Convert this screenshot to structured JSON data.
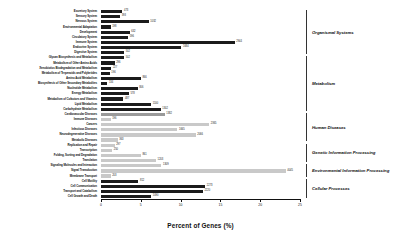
{
  "chart_data": {
    "type": "bar",
    "title": "",
    "xlabel": "Percent of Genes (%)",
    "ylabel": "",
    "xlim": [
      0,
      25
    ],
    "xticks": [
      0,
      5,
      10,
      15,
      20,
      25
    ],
    "xtick_labels": [
      "0",
      "5",
      "10",
      "15",
      "20",
      "25"
    ],
    "grid": false,
    "orientation": "horizontal",
    "legend": "none",
    "categories": [
      "Excretory System",
      "Sensory System",
      "Nervous System",
      "Environmental Adaptation",
      "Development",
      "Circulatory System",
      "Immune System",
      "Endocrine System",
      "Digestive System",
      "Glycan Biosynthesis and Metabolism",
      "Metabolism of Other Amino Acids",
      "Xenobiotics Biodegradation and Metabolism",
      "Metabolism of Terpenoids and Polyketides",
      "Amino Acid Metabolism",
      "Biosynthesis of Other Secondary Metabolites",
      "Nucleotide Metabolism",
      "Energy Metabolism",
      "Metabolism of Cofactors and Vitamins",
      "Lipid Metabolism",
      "Carbohydrate Metabolism",
      "Cardiovascular Diseases",
      "Immune Diseases",
      "Cancers",
      "Infectious Diseases",
      "Neurodegenerative Diseases",
      "Metabolic Diseases",
      "Replication and Repair",
      "Transcription",
      "Folding, Sorting and Degradation",
      "Translation",
      "Signaling Molecules and Interaction",
      "Signal Transduction",
      "Membrane Transport",
      "Cell Motility",
      "Cell Communication",
      "Transport and Catabolism",
      "Cell Growth and Death"
    ],
    "values": [
      2.7,
      2.4,
      6.0,
      1.2,
      3.6,
      3.4,
      16.8,
      10.1,
      2.9,
      2.9,
      1.7,
      1.3,
      1.1,
      5.0,
      0.8,
      4.6,
      3.5,
      2.8,
      6.3,
      7.5,
      8.0,
      1.2,
      13.6,
      9.6,
      11.9,
      2.1,
      1.7,
      1.4,
      5.0,
      6.9,
      7.6,
      23.2,
      1.2,
      4.7,
      13.1,
      12.8,
      6.3
    ],
    "bar_labels": [
      "473",
      "393",
      "1032",
      "198",
      "632",
      "596",
      "2944",
      "1684",
      "502",
      "502",
      "296",
      "227",
      "196",
      "866",
      "134",
      "806",
      "578",
      "487",
      "1100",
      "1302",
      "1382",
      "196",
      "2365",
      "1665",
      "2066",
      "363",
      "297",
      "250",
      "861",
      "1203",
      "1309",
      "4045",
      "203",
      "812",
      "2273",
      "2220",
      "1090"
    ],
    "bar_shades": [
      "dark",
      "dark",
      "dark",
      "dark",
      "dark",
      "dark",
      "dark",
      "dark",
      "dark",
      "dark",
      "dark",
      "dark",
      "dark",
      "dark",
      "dark",
      "dark",
      "dark",
      "dark",
      "dark",
      "dark",
      "mid",
      "light",
      "light",
      "light",
      "light",
      "light",
      "light",
      "light",
      "light",
      "light",
      "light",
      "light",
      "light",
      "dark",
      "dark",
      "dark",
      "dark"
    ],
    "groups": [
      {
        "label": "Organismal Systems",
        "start_index": 0,
        "end_index": 8
      },
      {
        "label": "Metabolism",
        "start_index": 9,
        "end_index": 19
      },
      {
        "label": "Human Diseases",
        "start_index": 20,
        "end_index": 25
      },
      {
        "label": "Genetic Information Processing",
        "start_index": 26,
        "end_index": 29
      },
      {
        "label": "Environmental Information Processing",
        "start_index": 30,
        "end_index": 32
      },
      {
        "label": "Cellular Processes",
        "start_index": 33,
        "end_index": 36
      }
    ]
  }
}
